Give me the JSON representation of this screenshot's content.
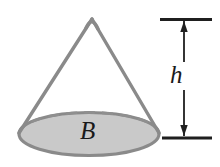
{
  "figure": {
    "background_color": "#ffffff",
    "width": 220,
    "height": 167
  },
  "labels": {
    "height_label": "h",
    "base_label": "B"
  },
  "colors": {
    "cone_outline": "#8a8a8a",
    "base_fill": "#c9c9c9",
    "base_outline": "#8a8a8a",
    "hidden_edge": "#8f8f8f",
    "dimension_line": "#1f1f1f",
    "label_text": "#1a1a1a"
  },
  "geometry": {
    "apex": {
      "x": 92,
      "y": 18
    },
    "base_ellipse": {
      "cx": 89,
      "cy": 134,
      "rx": 70,
      "ry": 22
    },
    "slant_left_end": {
      "x": 19,
      "y": 132
    },
    "slant_right_end": {
      "x": 159,
      "y": 132
    },
    "dimension_x": 184,
    "dimension_top_y": 19,
    "dimension_bottom_y": 138,
    "tick_x_start": 160,
    "tick_x_end": 212
  },
  "elements": {
    "cone_name": "cone-shape",
    "base_name": "cone-base-ellipse",
    "height_arrow_name": "height-dimension-arrow"
  }
}
